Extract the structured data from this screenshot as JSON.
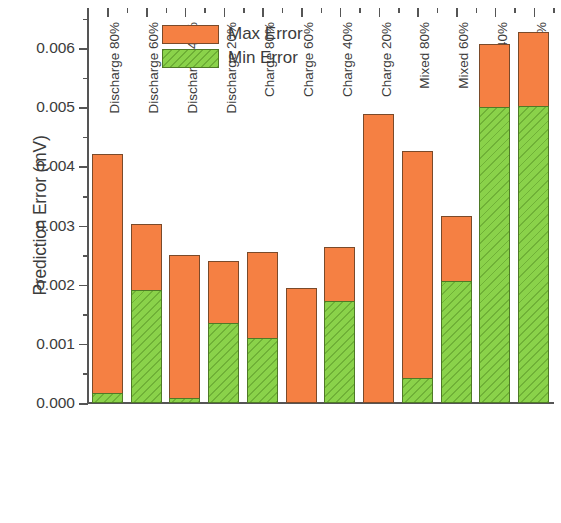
{
  "chart_data": {
    "type": "bar",
    "title": "",
    "subtitle": "",
    "xlabel": "",
    "ylabel": "Prediction Error (mV)",
    "categories": [
      "Discharge 80%",
      "Discharge 60%",
      "Discharge 40%",
      "Discharge 20%",
      "Charge 80%",
      "Charge 60%",
      "Charge 40%",
      "Charge 20%",
      "Mixed 80%",
      "Mixed 60%",
      "Mixed 40%",
      "Mixed 20%"
    ],
    "series": [
      {
        "name": "Max Error",
        "color": "#F58043",
        "values": [
          0.00421,
          0.00302,
          0.0025,
          0.0024,
          0.00255,
          0.00194,
          0.00264,
          0.00488,
          0.00427,
          0.00316,
          0.00607,
          0.00627
        ]
      },
      {
        "name": "Min Error",
        "color": "#8AD24A",
        "hatch": "diagonal",
        "values": [
          0.00017,
          0.00191,
          8e-05,
          0.00135,
          0.0011,
          0.0,
          0.00172,
          0.0,
          0.00043,
          0.00206,
          0.005,
          0.00502
        ]
      }
    ],
    "ylim": [
      0.0,
      0.00668
    ],
    "ytick_labels": [
      "0.000",
      "0.001",
      "0.002",
      "0.003",
      "0.004",
      "0.005",
      "0.006"
    ],
    "ytick_values": [
      0.0,
      0.001,
      0.002,
      0.003,
      0.004,
      0.005,
      0.006
    ],
    "yminor_values": [
      0.0005,
      0.0015,
      0.0025,
      0.0035,
      0.0045,
      0.0055,
      0.0065
    ],
    "grid": false,
    "legend_position": "top-left-inside",
    "bars_overlaid": true
  },
  "legend": {
    "items": [
      {
        "label": "Max Error",
        "style": "max"
      },
      {
        "label": "Min Error",
        "style": "min"
      }
    ]
  }
}
